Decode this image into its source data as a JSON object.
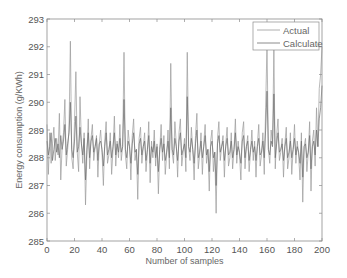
{
  "chart_data": {
    "type": "line",
    "title": "",
    "xlabel": "Number of samples",
    "ylabel": "Energy consumption (g/KWh)",
    "xlim": [
      0,
      200
    ],
    "ylim": [
      285,
      293
    ],
    "xticks": [
      0,
      20,
      40,
      60,
      80,
      100,
      120,
      140,
      160,
      180,
      200
    ],
    "yticks": [
      285,
      286,
      287,
      288,
      289,
      290,
      291,
      292,
      293
    ],
    "grid": false,
    "legend_position": "upper right",
    "series": [
      {
        "name": "Actual",
        "color": "#9a9a9a",
        "values": [
          289.2,
          287.4,
          288.9,
          287.8,
          288.5,
          289.1,
          287.9,
          288.7,
          288.1,
          289.6,
          287.2,
          288.4,
          288.9,
          290.1,
          287.7,
          288.3,
          289.0,
          292.2,
          288.0,
          287.6,
          289.3,
          291.1,
          288.2,
          287.5,
          290.2,
          288.6,
          287.8,
          288.9,
          286.3,
          288.1,
          289.4,
          287.6,
          288.7,
          289.2,
          287.9,
          288.4,
          288.8,
          287.3,
          288.5,
          289.0,
          288.2,
          287.0,
          288.6,
          289.3,
          287.8,
          288.1,
          288.9,
          287.4,
          288.3,
          289.5,
          287.7,
          288.6,
          288.0,
          289.2,
          287.9,
          288.4,
          291.8,
          288.1,
          287.6,
          289.0,
          288.5,
          287.2,
          288.8,
          289.4,
          287.9,
          288.3,
          286.5,
          288.7,
          289.1,
          287.8,
          288.4,
          288.9,
          287.5,
          288.2,
          289.3,
          287.1,
          288.6,
          288.0,
          289.0,
          287.7,
          288.5,
          286.7,
          288.3,
          289.2,
          287.9,
          288.8,
          287.4,
          288.1,
          289.0,
          287.6,
          291.4,
          288.2,
          287.8,
          289.3,
          288.5,
          287.3,
          288.9,
          289.4,
          287.7,
          288.2,
          288.7,
          287.5,
          291.8,
          288.4,
          287.9,
          289.1,
          288.3,
          287.2,
          288.8,
          289.6,
          287.6,
          288.1,
          288.9,
          287.4,
          288.5,
          289.2,
          287.8,
          288.3,
          286.8,
          288.6,
          289.0,
          287.5,
          288.2,
          286.0,
          288.7,
          289.3,
          287.9,
          288.4,
          288.8,
          287.3,
          288.5,
          289.1,
          287.7,
          288.0,
          288.9,
          287.6,
          288.3,
          289.4,
          287.8,
          288.6,
          288.1,
          287.2,
          288.9,
          289.3,
          287.6,
          288.4,
          288.8,
          287.5,
          288.2,
          289.0,
          287.9,
          288.6,
          287.3,
          288.5,
          289.2,
          287.7,
          288.1,
          288.9,
          287.4,
          289.8,
          292.1,
          288.3,
          287.8,
          289.0,
          288.5,
          291.9,
          287.6,
          288.8,
          289.4,
          287.9,
          288.2,
          288.7,
          287.3,
          288.5,
          289.1,
          287.6,
          288.0,
          288.9,
          287.4,
          288.3,
          289.2,
          287.8,
          288.6,
          288.1,
          287.2,
          288.9,
          286.4,
          288.4,
          288.7,
          287.5,
          288.2,
          289.3,
          286.8,
          288.6,
          289.0,
          287.7,
          289.8,
          288.4,
          290.5,
          291.0,
          292.0
        ]
      },
      {
        "name": "Calculate",
        "color": "#6e6e6e",
        "values": [
          288.6,
          288.1,
          288.4,
          288.9,
          287.9,
          288.3,
          288.7,
          288.2,
          288.5,
          288.0,
          288.8,
          288.3,
          288.6,
          289.2,
          288.1,
          288.5,
          288.9,
          290.0,
          288.3,
          288.0,
          288.6,
          289.5,
          288.2,
          288.4,
          289.1,
          288.5,
          288.1,
          288.7,
          287.2,
          288.3,
          288.9,
          288.0,
          288.6,
          288.8,
          288.2,
          288.4,
          288.7,
          287.9,
          288.5,
          288.6,
          288.3,
          287.7,
          288.4,
          288.9,
          288.1,
          288.3,
          288.6,
          288.0,
          288.4,
          288.9,
          288.1,
          288.5,
          288.2,
          288.7,
          288.2,
          288.4,
          290.1,
          288.3,
          288.0,
          288.6,
          288.4,
          287.8,
          288.5,
          288.9,
          288.2,
          288.3,
          287.4,
          288.5,
          288.7,
          288.1,
          288.4,
          288.6,
          287.9,
          288.3,
          288.8,
          287.8,
          288.4,
          288.2,
          288.6,
          288.0,
          288.4,
          287.5,
          288.3,
          288.7,
          288.2,
          288.5,
          287.9,
          288.2,
          288.6,
          288.0,
          289.8,
          288.3,
          288.1,
          288.7,
          288.4,
          287.9,
          288.6,
          288.9,
          288.1,
          288.3,
          288.5,
          288.0,
          290.2,
          288.4,
          288.2,
          288.7,
          288.3,
          287.8,
          288.5,
          289.0,
          288.0,
          288.2,
          288.6,
          288.0,
          288.4,
          288.8,
          288.1,
          288.3,
          287.5,
          288.4,
          288.6,
          288.0,
          288.2,
          287.0,
          288.5,
          288.8,
          288.2,
          288.4,
          288.6,
          287.9,
          288.4,
          288.7,
          288.1,
          288.2,
          288.6,
          288.0,
          288.3,
          288.9,
          288.1,
          288.4,
          288.2,
          287.8,
          288.6,
          288.8,
          288.0,
          288.4,
          288.6,
          287.9,
          288.3,
          288.6,
          288.2,
          288.4,
          287.9,
          288.4,
          288.7,
          288.1,
          288.2,
          288.6,
          288.0,
          289.0,
          290.4,
          288.3,
          288.1,
          288.6,
          288.4,
          290.3,
          288.0,
          288.5,
          288.9,
          288.2,
          288.3,
          288.5,
          287.9,
          288.4,
          288.7,
          288.0,
          288.2,
          288.6,
          288.0,
          288.3,
          288.7,
          288.1,
          288.4,
          288.2,
          287.8,
          288.6,
          287.3,
          288.4,
          288.5,
          288.0,
          288.2,
          288.8,
          287.6,
          288.4,
          288.6,
          288.1,
          289.0,
          288.4,
          289.4,
          289.8,
          290.6
        ]
      }
    ]
  },
  "legend": {
    "items": [
      {
        "label": "Actual",
        "color": "#9a9a9a"
      },
      {
        "label": "Calculate",
        "color": "#6e6e6e"
      }
    ]
  },
  "axes": {
    "frame_color": "#8c8c8c",
    "background": "#ffffff"
  }
}
